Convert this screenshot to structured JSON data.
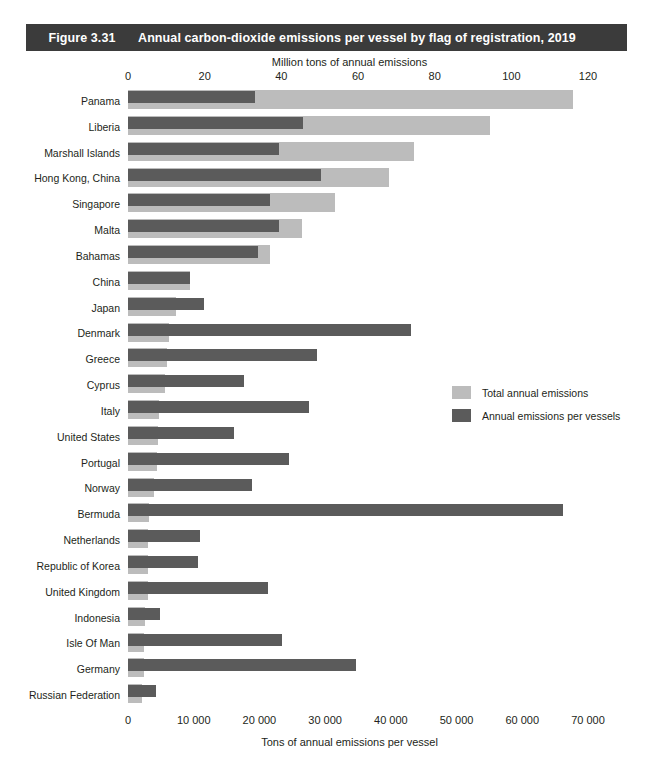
{
  "figure": {
    "number": "Figure 3.31",
    "title": "Annual carbon-dioxide emissions per vessel by flag of registration, 2019"
  },
  "colors": {
    "banner_background": "#3b3b3b",
    "banner_text": "#ffffff",
    "total_annual_emissions": "#bcbcbc",
    "annual_emissions_per_vessels": "#5b5b5b",
    "text": "#231f20",
    "page_background": "#ffffff"
  },
  "legend": {
    "position": "right-middle",
    "items": [
      {
        "label": "Total annual emissions",
        "color": "#bcbcbc",
        "swatch": "total"
      },
      {
        "label": "Annual emissions per vessels",
        "color": "#5b5b5b",
        "swatch": "vessel"
      }
    ]
  },
  "chart_data": {
    "type": "bar",
    "orientation": "horizontal",
    "title": "Annual carbon-dioxide emissions per vessel by flag of registration, 2019",
    "subtitle": "",
    "grid": false,
    "legend_position": "right-middle",
    "top_axis": {
      "label": "Million tons of annual emissions",
      "ticks": [
        0,
        20,
        40,
        60,
        80,
        100,
        120
      ],
      "tick_labels": [
        "0",
        "20",
        "40",
        "60",
        "80",
        "100",
        "120"
      ],
      "range": [
        0,
        120
      ],
      "series": "Total annual emissions",
      "units": "million tons"
    },
    "bottom_axis": {
      "label": "Tons of annual emissions per vessel",
      "ticks": [
        0,
        10000,
        20000,
        30000,
        40000,
        50000,
        60000,
        70000
      ],
      "tick_labels": [
        "0",
        "10 000",
        "20 000",
        "30 000",
        "40 000",
        "50 000",
        "60 000",
        "70 000"
      ],
      "range": [
        0,
        70000
      ],
      "series": "Annual emissions per vessels",
      "units": "tons per vessel"
    },
    "categories": [
      "Panama",
      "Liberia",
      "Marshall Islands",
      "Hong Kong, China",
      "Singapore",
      "Malta",
      "Bahamas",
      "China",
      "Japan",
      "Denmark",
      "Greece",
      "Cyprus",
      "Italy",
      "United States",
      "Portugal",
      "Norway",
      "Bermuda",
      "Netherlands",
      "Republic of Korea",
      "United Kingdom",
      "Indonesia",
      "Isle Of Man",
      "Germany",
      "Russian Federation"
    ],
    "series": [
      {
        "name": "Total annual emissions",
        "axis": "top",
        "units": "million tons",
        "color": "#bcbcbc",
        "values": [
          116.0,
          94.5,
          74.5,
          68.0,
          54.0,
          45.5,
          37.0,
          16.2,
          12.6,
          10.8,
          10.2,
          9.6,
          8.0,
          7.8,
          7.5,
          6.9,
          5.6,
          5.3,
          5.2,
          5.1,
          4.4,
          4.2,
          4.1,
          3.7
        ]
      },
      {
        "name": "Annual emissions per vessels",
        "axis": "bottom",
        "units": "tons per vessel",
        "color": "#5b5b5b",
        "values": [
          19400,
          26600,
          23000,
          29300,
          21600,
          23000,
          19800,
          9400,
          11600,
          43000,
          28800,
          17700,
          27500,
          16100,
          24500,
          18800,
          66200,
          11000,
          10700,
          21300,
          4800,
          23400,
          34700,
          4300
        ]
      }
    ]
  }
}
